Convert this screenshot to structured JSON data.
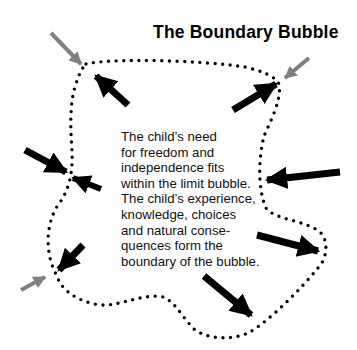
{
  "title": "The Boundary Bubble",
  "description": "The child’s need\nfor freedom and\nindependence fits\nwithin the limit bubble.\nThe child’s experience,\nknowledge, choices\nand natural conse-\nquences form the\nboundary of the bubble.",
  "colors": {
    "outward_arrow": "#000000",
    "inward_arrow": "#000000",
    "external_arrow": "#808080",
    "boundary_dots": "#000000"
  },
  "diagram": {
    "boundary": "dotted-closed-curve",
    "arrows": [
      {
        "name": "outward-arrow-top-left",
        "direction": "outward",
        "color": "black"
      },
      {
        "name": "outward-arrow-top-right",
        "direction": "outward",
        "color": "black"
      },
      {
        "name": "inward-arrow-left",
        "direction": "inward",
        "color": "black"
      },
      {
        "name": "outward-arrow-left",
        "direction": "outward",
        "color": "black"
      },
      {
        "name": "inward-arrow-right",
        "direction": "inward",
        "color": "black"
      },
      {
        "name": "outward-arrow-right",
        "direction": "outward",
        "color": "black"
      },
      {
        "name": "outward-arrow-bottom-left",
        "direction": "outward",
        "color": "black"
      },
      {
        "name": "outward-arrow-bottom",
        "direction": "outward",
        "color": "black"
      },
      {
        "name": "external-arrow-top-left",
        "direction": "inward",
        "color": "gray"
      },
      {
        "name": "external-arrow-top-right",
        "direction": "inward",
        "color": "gray"
      },
      {
        "name": "external-arrow-bottom-left",
        "direction": "inward",
        "color": "gray"
      }
    ]
  }
}
